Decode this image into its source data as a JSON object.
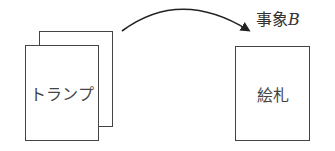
{
  "diagram": {
    "source": {
      "label": "トランプ",
      "stacked_cards": 2
    },
    "target": {
      "label": "絵札"
    },
    "arrow": {
      "label_prefix": "事象",
      "label_var": "B",
      "direction": "source-to-target"
    }
  },
  "colors": {
    "stroke": "#444444",
    "arrow": "#222222",
    "background": "#ffffff"
  }
}
